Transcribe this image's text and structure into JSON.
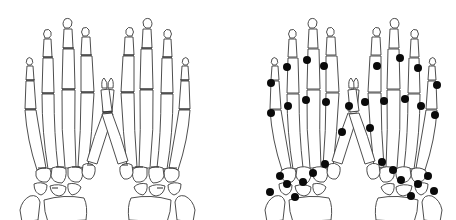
{
  "figure": {
    "description": "Dorsal view of two pairs of hand skeletons; the right pair marks joint sites with black dots",
    "colors": {
      "background": "#ffffff",
      "outline": "#3a3a3a",
      "marker": "#0a0a0a"
    },
    "panels": [
      {
        "id": "left-panel",
        "label": "",
        "hands": [
          "right-hand-dorsal",
          "left-hand-dorsal"
        ],
        "markers": "none"
      },
      {
        "id": "right-panel",
        "label": "",
        "hands": [
          "right-hand-dorsal",
          "left-hand-dorsal"
        ],
        "markers": "black-dots"
      }
    ],
    "marker_points": {
      "hand3": [
        [
          271,
          83
        ],
        [
          271,
          113
        ],
        [
          287,
          67
        ],
        [
          288,
          106
        ],
        [
          307,
          60
        ],
        [
          306,
          100
        ],
        [
          324,
          66
        ],
        [
          326,
          102
        ],
        [
          349,
          106
        ],
        [
          342,
          132
        ],
        [
          325,
          164
        ],
        [
          313,
          173
        ],
        [
          303,
          182
        ],
        [
          280,
          176
        ],
        [
          287,
          184
        ],
        [
          270,
          192
        ],
        [
          295,
          197
        ]
      ],
      "hand4": [
        [
          365,
          102
        ],
        [
          370,
          128
        ],
        [
          377,
          66
        ],
        [
          384,
          101
        ],
        [
          400,
          58
        ],
        [
          405,
          99
        ],
        [
          418,
          68
        ],
        [
          421,
          106
        ],
        [
          437,
          85
        ],
        [
          435,
          115
        ],
        [
          382,
          162
        ],
        [
          393,
          170
        ],
        [
          401,
          180
        ],
        [
          418,
          184
        ],
        [
          428,
          176
        ],
        [
          434,
          191
        ],
        [
          411,
          196
        ]
      ]
    },
    "marker_count_per_hand": 17
  }
}
